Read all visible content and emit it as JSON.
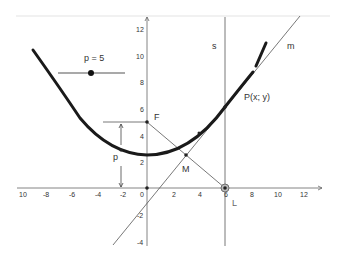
{
  "slider": {
    "label": "p = 5",
    "value": 5
  },
  "labels": {
    "focus": "F",
    "midpoint": "M",
    "point_p": "P(x; y)",
    "foot": "L",
    "line_s": "s",
    "line_m": "m",
    "distance_p": "p"
  },
  "axes": {
    "x_ticks": [
      "10",
      "-8",
      "-6",
      "-4",
      "-2",
      "0",
      "2",
      "4",
      "6",
      "8",
      "10",
      "12"
    ],
    "y_ticks": [
      "12",
      "10",
      "8",
      "6",
      "4",
      "2",
      "-2",
      "-4"
    ]
  },
  "colors": {
    "curve": "#1a1a1a",
    "lines": "#555555",
    "axes": "#666666",
    "topline": "#e0e0e0"
  }
}
